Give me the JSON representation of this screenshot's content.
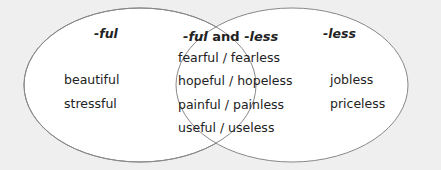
{
  "diagram": {
    "type": "venn",
    "colors": {
      "background": "#efefef",
      "circle_fill": "#ffffff",
      "circle_stroke": "#888888",
      "text": "#222222"
    },
    "left": {
      "title": "-ful",
      "items": [
        "beautiful",
        "stressful"
      ]
    },
    "intersection": {
      "title_part1": "-ful",
      "title_part2": " and ",
      "title_part3": "-less",
      "items": [
        "fearful / fearless",
        "hopeful / hopeless",
        "painful / painless",
        "useful / useless"
      ]
    },
    "right": {
      "title": "-less",
      "items": [
        "jobless",
        "priceless"
      ]
    }
  }
}
